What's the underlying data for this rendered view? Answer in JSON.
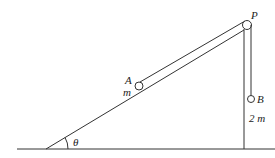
{
  "diagram": {
    "type": "physics-incline-pulley",
    "labels": {
      "pulley": "P",
      "block_a": "A",
      "mass_a": "m",
      "block_b": "B",
      "mass_b": "2 m",
      "angle": "θ"
    },
    "colors": {
      "line": "#333333",
      "background": "#ffffff"
    }
  }
}
